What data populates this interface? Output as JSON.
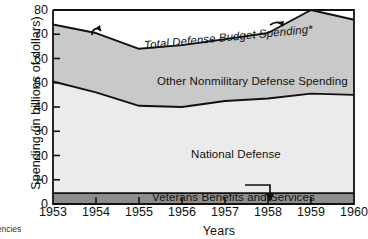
{
  "chart_data": {
    "type": "area",
    "stacked": true,
    "title": "",
    "xlabel": "Years",
    "ylabel": "Spending (in billions of dollars)",
    "categories": [
      "1953",
      "1954",
      "1955",
      "1956",
      "1957",
      "1958",
      "1959",
      "1960"
    ],
    "x": [
      1953,
      1954,
      1955,
      1956,
      1957,
      1958,
      1959,
      1960
    ],
    "xlim": [
      1953,
      1960
    ],
    "ylim": [
      0,
      80
    ],
    "yticks": [
      0,
      10,
      20,
      30,
      40,
      50,
      60,
      70,
      80
    ],
    "grid": false,
    "legend_position": "inline-labels",
    "series": [
      {
        "name": "Veterans Benefits and Services",
        "color": "#8d8d8d",
        "values": [
          4.5,
          4.5,
          4.5,
          4.5,
          4.5,
          4.5,
          4.5,
          4.5
        ]
      },
      {
        "name": "National Defense",
        "color": "#ebebeb",
        "values": [
          46.0,
          41.5,
          36.0,
          35.5,
          38.0,
          39.0,
          41.0,
          40.5
        ]
      },
      {
        "name": "Other Nonmilitary Defense Spending",
        "color": "#c9c9c9",
        "values": [
          23.5,
          24.5,
          23.5,
          25.5,
          25.5,
          27.0,
          34.5,
          31.0
        ]
      }
    ],
    "cumulative_boundaries": {
      "veterans_top": [
        4.5,
        4.5,
        4.5,
        4.5,
        4.5,
        4.5,
        4.5,
        4.5
      ],
      "national_defense_top": [
        50.5,
        46.0,
        40.5,
        40.0,
        42.5,
        43.5,
        45.5,
        45.0
      ],
      "total_defense_budget_spending": [
        74.0,
        70.5,
        64.0,
        65.5,
        68.0,
        70.5,
        80.0,
        76.0
      ]
    },
    "annotations": [
      {
        "name": "total-defense-label",
        "text": "Total Defense Budget Spending*",
        "leader": "hooked arrows to upper boundary"
      },
      {
        "name": "other-nonmilitary-label",
        "text": "Other Nonmilitary Defense Spending"
      },
      {
        "name": "national-defense-label",
        "text": "National Defense"
      },
      {
        "name": "veterans-label",
        "text": "Veterans Benefits and Services",
        "leader": "line with down arrow into band"
      }
    ]
  },
  "axes": {
    "y_label": "Spending (in billions of dollars)",
    "x_label": "Years",
    "y_ticks": [
      "80",
      "70",
      "60",
      "50",
      "40",
      "30",
      "20",
      "10",
      "0"
    ],
    "x_ticks": [
      "1953",
      "1954",
      "1955",
      "1956",
      "1957",
      "1958",
      "1959",
      "1960"
    ]
  },
  "labels": {
    "total": "Total Defense Budget Spending*",
    "other": "Other Nonmilitary Defense Spending",
    "national": "National Defense",
    "veterans": "Veterans Benefits and Services"
  },
  "footnote": "gencies",
  "colors": {
    "band_top": "#c9c9c9",
    "band_middle": "#ebebeb",
    "band_bottom": "#8d8d8d",
    "axis": "#111111",
    "line": "#111111"
  }
}
